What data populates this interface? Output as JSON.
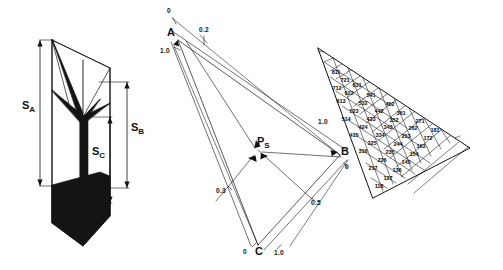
{
  "figure": {
    "ink_color": "#111111",
    "fill_color": "#141414",
    "background": "#ffffff"
  },
  "panel_left": {
    "name": "wedge-span-diagram",
    "span_labels": [
      {
        "id": "sa",
        "base": "S",
        "sub": "A",
        "x": 22,
        "y": 106
      },
      {
        "id": "sb",
        "base": "S",
        "sub": "B",
        "x": 122,
        "y": 128
      },
      {
        "id": "sc",
        "base": "S",
        "sub": "C",
        "x": 98,
        "y": 152
      }
    ]
  },
  "panel_middle": {
    "name": "barycentric-construction",
    "vertices": [
      {
        "id": "A",
        "base": "A",
        "sub": "",
        "x": 170,
        "y": 33
      },
      {
        "id": "B",
        "base": "B",
        "sub": "",
        "x": 344,
        "y": 152
      },
      {
        "id": "C",
        "base": "C",
        "sub": "",
        "x": 257,
        "y": 252
      }
    ],
    "point": {
      "id": "PS",
      "base": "P",
      "sub": "S",
      "x": 258,
      "y": 147
    },
    "tick_labels": [
      {
        "text": "0",
        "x": 167,
        "y": 10
      },
      {
        "text": "0.2",
        "x": 205,
        "y": 30
      },
      {
        "text": "1.0",
        "x": 163,
        "y": 53
      },
      {
        "text": "1.0",
        "x": 323,
        "y": 123
      },
      {
        "text": "0",
        "x": 345,
        "y": 168
      },
      {
        "text": "0.3",
        "x": 222,
        "y": 192
      },
      {
        "text": "0.5",
        "x": 315,
        "y": 205
      },
      {
        "text": "0",
        "x": 243,
        "y": 253
      },
      {
        "text": "1.0",
        "x": 279,
        "y": 254
      }
    ]
  },
  "panel_right": {
    "name": "composition-triangle",
    "cells": [
      {
        "text": "811",
        "x": 336,
        "y": 72
      },
      {
        "text": "721",
        "x": 345,
        "y": 80
      },
      {
        "text": "631",
        "x": 357,
        "y": 85
      },
      {
        "text": "712",
        "x": 337,
        "y": 88
      },
      {
        "text": "622",
        "x": 349,
        "y": 93
      },
      {
        "text": "541",
        "x": 371,
        "y": 95
      },
      {
        "text": "613",
        "x": 341,
        "y": 101
      },
      {
        "text": "532",
        "x": 363,
        "y": 103
      },
      {
        "text": "452",
        "x": 390,
        "y": 104
      },
      {
        "text": "442",
        "x": 379,
        "y": 111
      },
      {
        "text": "523",
        "x": 354,
        "y": 111
      },
      {
        "text": "361",
        "x": 401,
        "y": 113
      },
      {
        "text": "352",
        "x": 394,
        "y": 120
      },
      {
        "text": "514",
        "x": 346,
        "y": 119
      },
      {
        "text": "433",
        "x": 371,
        "y": 119
      },
      {
        "text": "271",
        "x": 420,
        "y": 121
      },
      {
        "text": "343",
        "x": 388,
        "y": 127
      },
      {
        "text": "424",
        "x": 363,
        "y": 127
      },
      {
        "text": "262",
        "x": 413,
        "y": 128
      },
      {
        "text": "181",
        "x": 435,
        "y": 130
      },
      {
        "text": "415",
        "x": 354,
        "y": 135
      },
      {
        "text": "334",
        "x": 380,
        "y": 135
      },
      {
        "text": "253",
        "x": 406,
        "y": 136
      },
      {
        "text": "172",
        "x": 428,
        "y": 138
      },
      {
        "text": "325",
        "x": 372,
        "y": 143
      },
      {
        "text": "244",
        "x": 398,
        "y": 144
      },
      {
        "text": "163",
        "x": 421,
        "y": 146
      },
      {
        "text": "316",
        "x": 363,
        "y": 151
      },
      {
        "text": "235",
        "x": 390,
        "y": 152
      },
      {
        "text": "154",
        "x": 414,
        "y": 154
      },
      {
        "text": "226",
        "x": 382,
        "y": 160
      },
      {
        "text": "145",
        "x": 406,
        "y": 162
      },
      {
        "text": "217",
        "x": 373,
        "y": 168
      },
      {
        "text": "136",
        "x": 397,
        "y": 170
      },
      {
        "text": "127",
        "x": 388,
        "y": 178
      },
      {
        "text": "118",
        "x": 379,
        "y": 186
      }
    ]
  }
}
